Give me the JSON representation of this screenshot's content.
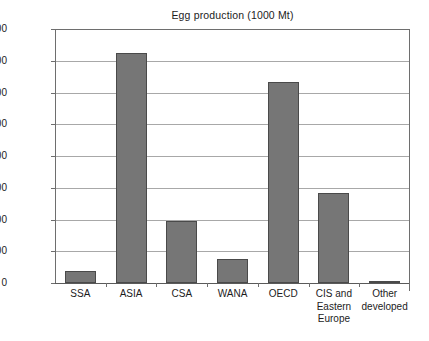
{
  "chart_data": {
    "type": "bar",
    "title": "Egg production (1000 Mt)",
    "xlabel": "",
    "ylabel": "",
    "ylim": [
      0,
      16000
    ],
    "ytick_step": 2000,
    "grid": true,
    "legend": "none",
    "categories": [
      "SSA",
      "ASIA",
      "CSA",
      "WANA",
      "OECD",
      "CIS and Eastern Europe",
      "Other developed"
    ],
    "category_label_lines": [
      [
        "SSA"
      ],
      [
        "ASIA"
      ],
      [
        "CSA"
      ],
      [
        "WANA"
      ],
      [
        "OECD"
      ],
      [
        "CIS and",
        "Eastern",
        "Europe"
      ],
      [
        "Other",
        "developed"
      ]
    ],
    "values": [
      780,
      14500,
      3900,
      1500,
      12650,
      5700,
      150
    ],
    "ytick_labels": [
      "0",
      "2,000",
      "4,000",
      "6,000",
      "8,000",
      "10,000",
      "12,000",
      "14,000",
      "16,000"
    ],
    "ytick_values": [
      0,
      2000,
      4000,
      6000,
      8000,
      10000,
      12000,
      14000,
      16000
    ],
    "colors": {
      "bar_fill": "#767676",
      "bar_stroke": "#4a4a4a",
      "grid": "#a8a8a8",
      "axis": "#6e6e6e",
      "text": "#1c1c1c",
      "background": "#ffffff"
    }
  }
}
